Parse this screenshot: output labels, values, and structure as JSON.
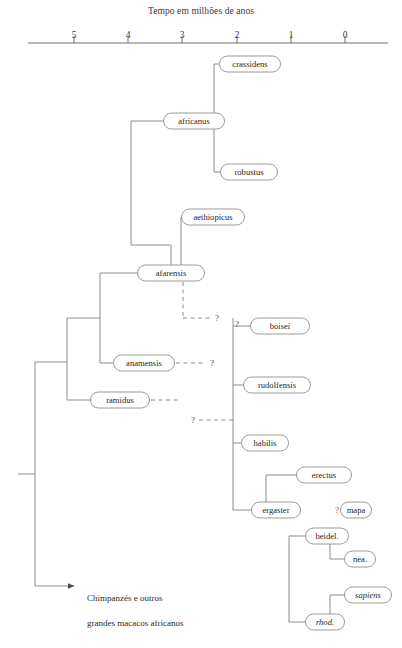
{
  "axis": {
    "title": "Tempo em milhões de anos",
    "ticks": [
      {
        "label": "5",
        "x": 74
      },
      {
        "label": "4",
        "x": 128
      },
      {
        "label": "3",
        "x": 182
      },
      {
        "label": "2",
        "x": 237
      },
      {
        "label": "1",
        "x": 291
      },
      {
        "label": "0",
        "x": 345
      }
    ],
    "line": {
      "x1": 28,
      "x2": 388,
      "y": 43
    },
    "tick_height": 7,
    "label_y": 30
  },
  "style": {
    "line_color": "#8c8c8c",
    "node_border": "#9a9a9a",
    "node_fill": "#ffffff",
    "text_color": "#1f1f1f"
  },
  "nodes": [
    {
      "id": "crassidens",
      "label": "crassidens",
      "cx": 250,
      "cy": 64,
      "w": 62,
      "italic": false
    },
    {
      "id": "africanus",
      "label": "africanus",
      "cx": 194,
      "cy": 121,
      "w": 62,
      "italic": false
    },
    {
      "id": "robustus",
      "label": "robustus",
      "cx": 249,
      "cy": 172,
      "w": 58,
      "italic": false
    },
    {
      "id": "aethiopicus",
      "label": "aethiopicus",
      "cx": 213,
      "cy": 217,
      "w": 64,
      "italic": false
    },
    {
      "id": "afarensis",
      "label": "afarensis",
      "cx": 171,
      "cy": 273,
      "w": 68,
      "italic": false
    },
    {
      "id": "boisei",
      "label": "boisei",
      "cx": 280,
      "cy": 326,
      "w": 60,
      "italic": false
    },
    {
      "id": "anamensis",
      "label": "anamensis",
      "cx": 144,
      "cy": 363,
      "w": 62,
      "italic": false
    },
    {
      "id": "rudolfensis",
      "label": "rudolfensis",
      "cx": 277,
      "cy": 385,
      "w": 68,
      "italic": false
    },
    {
      "id": "ramidus",
      "label": "ramidus",
      "cx": 120,
      "cy": 400,
      "w": 60,
      "italic": false
    },
    {
      "id": "habilis",
      "label": "habilis",
      "cx": 265,
      "cy": 443,
      "w": 48,
      "italic": false
    },
    {
      "id": "erectus",
      "label": "erectus",
      "cx": 324,
      "cy": 475,
      "w": 56,
      "italic": false
    },
    {
      "id": "ergaster",
      "label": "ergaster",
      "cx": 276,
      "cy": 510,
      "w": 50,
      "italic": false
    },
    {
      "id": "mapa",
      "label": "mapa",
      "cx": 356,
      "cy": 510,
      "w": 32,
      "italic": false
    },
    {
      "id": "heidel",
      "label": "heidel.",
      "cx": 327,
      "cy": 536,
      "w": 44,
      "italic": false
    },
    {
      "id": "nea",
      "label": "nea.",
      "cx": 360,
      "cy": 559,
      "w": 32,
      "italic": false
    },
    {
      "id": "sapiens",
      "label": "sapiens",
      "cx": 368,
      "cy": 595,
      "w": 48,
      "italic": true
    },
    {
      "id": "rhod",
      "label": "rhod.",
      "cx": 325,
      "cy": 622,
      "w": 40,
      "italic": true
    }
  ],
  "question_marks": [
    {
      "id": "q-afarensis",
      "label": "?",
      "x": 217,
      "y": 318
    },
    {
      "id": "q-boisei",
      "label": "?",
      "x": 237,
      "y": 324
    },
    {
      "id": "q-anamensis",
      "label": "?",
      "x": 212,
      "y": 363
    },
    {
      "id": "q-habilis",
      "label": "?",
      "x": 193,
      "y": 420
    },
    {
      "id": "q-mapa",
      "label": "?",
      "x": 337,
      "y": 510
    }
  ],
  "outgroup": {
    "line1": "Chimpanzés e outros",
    "line2": "grandes macacos africanos",
    "text_x": 78,
    "text_y": 579,
    "arrow_y": 586,
    "arrow_x1": 35,
    "arrow_x2": 74
  },
  "solid_paths": [
    "M 18 474 L 35 474",
    "M 35 362 L 35 586",
    "M 35 362 L 67 362",
    "M 67 318 L 67 400",
    "M 67 318 L 100 318",
    "M 100 273 L 100 363",
    "M 100 273 L 137 273",
    "M 100 363 L 113 363",
    "M 67 400 L 90 400",
    "M 171 245 L 171 265",
    "M 171 245 L 131 245",
    "M 131 121 L 131 245",
    "M 131 121 L 163 121",
    "M 214 64 L 214 172",
    "M 214 64 L 219 64",
    "M 214 172 L 220 172",
    "M 214 121 L 225 121",
    "M 181 217 L 205 217",
    "M 181 217 L 181 265",
    "M 233 318 L 233 510",
    "M 233 326 L 250 326",
    "M 233 385 L 243 385",
    "M 233 420 L 233 421",
    "M 233 443 L 241 443",
    "M 233 510 L 251 510",
    "M 266 475 L 266 510",
    "M 266 475 L 296 475",
    "M 289 536 L 289 622",
    "M 289 536 L 305 536",
    "M 289 622 L 305 622",
    "M 330 559 L 330 536",
    "M 330 559 L 344 559",
    "M 330 595 L 330 622",
    "M 330 595 L 344 595"
  ],
  "dashed_paths": [
    "M 183 282 L 183 318",
    "M 183 318 L 211 318",
    "M 176 363 L 206 363",
    "M 151 400 L 178 400",
    "M 199 420 L 233 420"
  ]
}
